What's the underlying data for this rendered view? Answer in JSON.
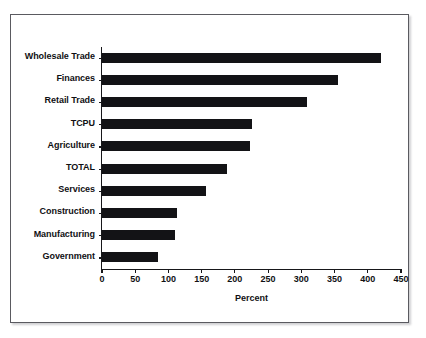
{
  "chart_data": {
    "type": "bar",
    "orientation": "horizontal",
    "title": "",
    "xlabel": "Percent",
    "ylabel": "",
    "xlim": [
      0,
      450
    ],
    "xticks": [
      0,
      50,
      100,
      150,
      200,
      250,
      300,
      350,
      400,
      450
    ],
    "grid": false,
    "legend": null,
    "bar_color": "#131316",
    "categories": [
      "Wholesale Trade",
      "Finances",
      "Retail Trade",
      "TCPU",
      "Agriculture",
      "TOTAL",
      "Services",
      "Construction",
      "Manufacturing",
      "Government"
    ],
    "values": [
      420,
      355,
      308,
      226,
      223,
      188,
      156,
      113,
      110,
      85
    ]
  }
}
